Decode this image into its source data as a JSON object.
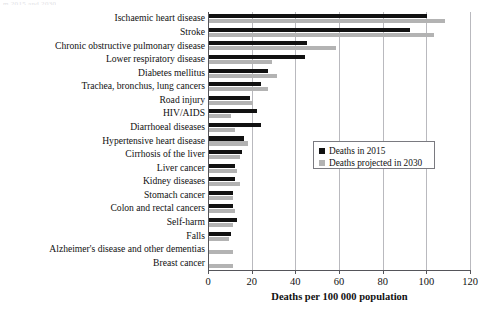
{
  "caption_remnant": "m 2015 and 2030",
  "chart_data": {
    "type": "bar",
    "orientation": "horizontal",
    "title": "",
    "xlabel": "Deaths per 100 000 population",
    "ylabel": "",
    "xlim": [
      0,
      120
    ],
    "xticks": [
      0,
      20,
      40,
      60,
      80,
      100,
      120
    ],
    "grid": true,
    "legend_position": "inside lower-right",
    "categories": [
      "Ischaemic heart disease",
      "Stroke",
      "Chronic obstructive pulmonary disease",
      "Lower respiratory disease",
      "Diabetes mellitus",
      "Trachea, bronchus, lung cancers",
      "Road injury",
      "HIV/AIDS",
      "Diarrhoeal diseases",
      "Hypertensive heart disease",
      "Cirrhosis of the liver",
      "Liver cancer",
      "Kidney diseases",
      "Stomach cancer",
      "Colon and rectal cancers",
      "Self-harm",
      "Falls",
      "Alzheimer's disease and other dementias",
      "Breast cancer"
    ],
    "series": [
      {
        "name": "Deaths in 2015",
        "color": "#111111",
        "values": [
          100,
          92,
          45,
          44,
          27,
          24,
          19,
          22,
          24,
          16,
          15,
          12,
          12,
          11,
          11,
          13,
          10,
          0,
          0
        ]
      },
      {
        "name": "Deaths projected in 2030",
        "color": "#b3b3b3",
        "values": [
          108,
          103,
          58,
          29,
          31,
          27,
          20,
          10,
          12,
          18,
          14,
          13,
          14,
          11,
          12,
          11,
          9,
          11,
          11
        ]
      }
    ]
  },
  "legend": {
    "items": [
      {
        "label": "Deaths in 2015",
        "color": "#111111"
      },
      {
        "label": "Deaths projected in 2030",
        "color": "#b3b3b3"
      }
    ]
  }
}
